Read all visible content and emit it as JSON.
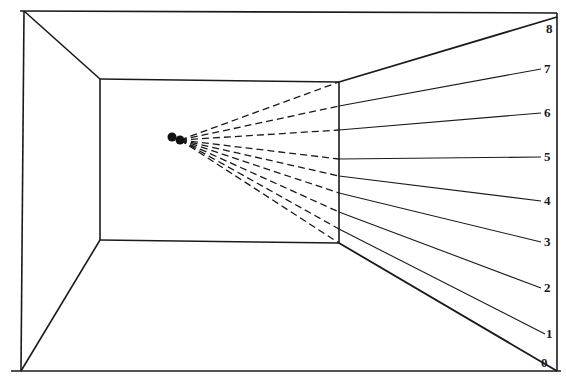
{
  "diagram": {
    "colors": {
      "line": "#1a1a1a",
      "background": "#ffffff"
    },
    "room": {
      "outer": {
        "top_left": [
          24,
          11
        ],
        "top_right": [
          557,
          13
        ],
        "bottom_left": [
          21,
          371
        ],
        "bottom_right": [
          557,
          371
        ]
      },
      "back_wall": {
        "top_left": [
          100,
          79
        ],
        "top_right": [
          339,
          82
        ],
        "bottom_left": [
          100,
          240
        ],
        "bottom_right": [
          339,
          243
        ]
      }
    },
    "observer": {
      "eyes": [
        {
          "cx": 172,
          "cy": 137,
          "r": 4.5
        },
        {
          "cx": 180,
          "cy": 140,
          "r": 4.5
        }
      ]
    },
    "sightlines": [
      {
        "label": "0",
        "wall_point": [
          339,
          243
        ],
        "end_point": [
          557,
          371
        ],
        "label_pos": [
          541,
          356
        ]
      },
      {
        "label": "1",
        "wall_point": [
          339,
          229
        ],
        "end_point": [
          545,
          334
        ],
        "label_pos": [
          546,
          327
        ]
      },
      {
        "label": "2",
        "wall_point": [
          339,
          212
        ],
        "end_point": [
          541,
          288
        ],
        "label_pos": [
          544,
          281
        ]
      },
      {
        "label": "3",
        "wall_point": [
          339,
          193
        ],
        "end_point": [
          541,
          242
        ],
        "label_pos": [
          544,
          235
        ]
      },
      {
        "label": "4",
        "wall_point": [
          339,
          176
        ],
        "end_point": [
          541,
          201
        ],
        "label_pos": [
          544,
          194
        ]
      },
      {
        "label": "5",
        "wall_point": [
          339,
          159
        ],
        "end_point": [
          541,
          157
        ],
        "label_pos": [
          544,
          150
        ]
      },
      {
        "label": "6",
        "wall_point": [
          339,
          130
        ],
        "end_point": [
          541,
          113
        ],
        "label_pos": [
          544,
          106
        ]
      },
      {
        "label": "7",
        "wall_point": [
          339,
          106
        ],
        "end_point": [
          541,
          69
        ],
        "label_pos": [
          544,
          62
        ]
      },
      {
        "label": "8",
        "wall_point": [
          339,
          82
        ],
        "end_point": [
          557,
          17
        ],
        "label_pos": [
          546,
          22
        ]
      }
    ]
  }
}
